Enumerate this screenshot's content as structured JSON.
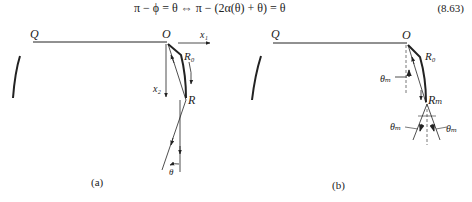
{
  "equation": {
    "text": "π − ϕ = θ ⇔ π − (2α(θ) + θ) = θ",
    "number": "(8.63)"
  },
  "figure_a": {
    "caption": "(a)",
    "labels": {
      "Q": "Q",
      "O": "O",
      "x1": "x₁",
      "x2": "x₂",
      "R0": "R₀",
      "R": "R",
      "theta": "θ"
    }
  },
  "figure_b": {
    "caption": "(b)",
    "labels": {
      "Q": "Q",
      "O": "O",
      "R0": "R₀",
      "Rm": "Rₘ",
      "theta_m_upper": "θₘ",
      "theta_m_left": "θₘ",
      "theta_m_right": "θₘ"
    }
  },
  "colors": {
    "ink": "#222222",
    "dashed": "#555555",
    "background": "#ffffff"
  }
}
